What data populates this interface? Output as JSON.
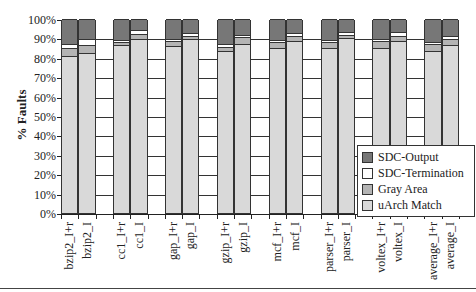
{
  "chart_data": {
    "type": "bar",
    "stacked": true,
    "title": "",
    "xlabel": "",
    "ylabel": "% Faults",
    "ylim": [
      0,
      100
    ],
    "yticks": [
      "0%",
      "10%",
      "20%",
      "30%",
      "40%",
      "50%",
      "60%",
      "70%",
      "80%",
      "90%",
      "100%"
    ],
    "grid": true,
    "legend_position": "right-inside",
    "categories": [
      "bzip2_I+r",
      "bzip2_I",
      "cc1_I+r",
      "cc1_I",
      "gap_I+r",
      "gap_I",
      "gzip_I+r",
      "gzip_I",
      "mcf_I+r",
      "mcf_I",
      "parser_I+r",
      "parser_I",
      "voltex_I+r",
      "voltex_I",
      "average_I+r",
      "average_I"
    ],
    "groups": [
      [
        "bzip2_I+r",
        "bzip2_I"
      ],
      [
        "cc1_I+r",
        "cc1_I"
      ],
      [
        "gap_I+r",
        "gap_I"
      ],
      [
        "gzip_I+r",
        "gzip_I"
      ],
      [
        "mcf_I+r",
        "mcf_I"
      ],
      [
        "parser_I+r",
        "parser_I"
      ],
      [
        "voltex_I+r",
        "voltex_I"
      ],
      [
        "average_I+r",
        "average_I"
      ]
    ],
    "series": [
      {
        "name": "uArch Match",
        "color": "#d9d9d9",
        "values": [
          81,
          82.5,
          86.5,
          89.5,
          86,
          89.5,
          83.5,
          87,
          85,
          88.5,
          85,
          90,
          85,
          88.5,
          83.5,
          86.5
        ]
      },
      {
        "name": "Gray Area",
        "color": "#b4b4b4",
        "values": [
          4,
          4,
          1.5,
          3,
          2.5,
          2,
          2,
          3.5,
          3,
          2.5,
          3,
          2,
          3.5,
          3,
          3.5,
          3
        ]
      },
      {
        "name": "SDC-Termination",
        "color": "#ffffff",
        "values": [
          2,
          3,
          1,
          2,
          1,
          1.5,
          1.5,
          1.5,
          1,
          2,
          1,
          1.5,
          1,
          2,
          1,
          2
        ]
      },
      {
        "name": "SDC-Output",
        "color": "#777777",
        "values": [
          13,
          10.5,
          11,
          5.5,
          10.5,
          7,
          13,
          8,
          11,
          7,
          11,
          6.5,
          10.5,
          6.5,
          12,
          8.5
        ]
      }
    ]
  },
  "legend": {
    "items": [
      {
        "label": "SDC-Output",
        "color": "#777777"
      },
      {
        "label": "SDC-Termination",
        "color": "#ffffff"
      },
      {
        "label": "Gray Area",
        "color": "#b4b4b4"
      },
      {
        "label": "uArch Match",
        "color": "#d9d9d9"
      }
    ]
  }
}
